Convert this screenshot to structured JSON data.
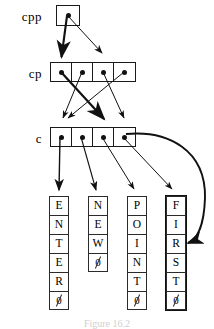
{
  "figure": {
    "caption": "Figure 16.2",
    "ink_color": "#111111",
    "background": "#ffffff"
  },
  "labels": {
    "cpp": "cpp",
    "cp": "cp",
    "c": "c"
  },
  "pointer_boxes": {
    "cpp": {
      "name": "cpp",
      "cells": 1
    },
    "cp": {
      "name": "cp",
      "cells": 4
    },
    "c": {
      "name": "c",
      "cells": 4
    }
  },
  "strings": [
    {
      "text": "ENTER",
      "highlighted": false,
      "chars": [
        "E",
        "N",
        "T",
        "E",
        "R",
        "\u0000"
      ]
    },
    {
      "text": "NEW",
      "highlighted": false,
      "chars": [
        "N",
        "E",
        "W",
        "\u0000"
      ]
    },
    {
      "text": "POINT",
      "highlighted": false,
      "chars": [
        "P",
        "O",
        "I",
        "N",
        "T",
        "\u0000"
      ]
    },
    {
      "text": "FIRST",
      "highlighted": true,
      "chars": [
        "F",
        "I",
        "R",
        "S",
        "T",
        "\u0000"
      ]
    }
  ],
  "null_glyph": "0"
}
